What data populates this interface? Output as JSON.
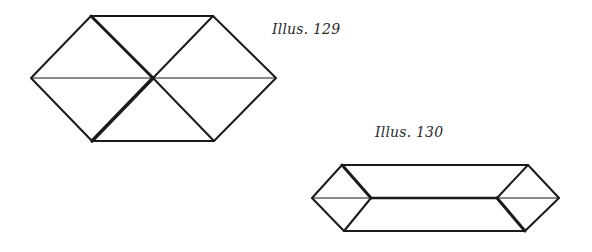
{
  "illustrations": [
    {
      "id": "129",
      "label": "Illus. 129",
      "shape": "hexagon divided into six triangles",
      "vertices": {
        "left": [
          31,
          78
        ],
        "top_left": [
          91,
          16
        ],
        "top_right": [
          213,
          16
        ],
        "right": [
          276,
          78
        ],
        "bottom_right": [
          214,
          141
        ],
        "bottom_left": [
          92,
          141
        ],
        "center": [
          153,
          78
        ]
      }
    },
    {
      "id": "130",
      "label": "Illus. 130",
      "shape": "elongated hexagon with end diamonds",
      "vertices": {
        "left": [
          312,
          198
        ],
        "top_left": [
          342,
          165
        ],
        "top_right": [
          528,
          165
        ],
        "right": [
          559,
          198
        ],
        "bottom_right": [
          525,
          231
        ],
        "bottom_left": [
          344,
          231
        ],
        "inner_left": [
          371,
          198
        ],
        "inner_right": [
          497,
          198
        ]
      }
    }
  ],
  "colors": {
    "line": "#1a1a1a",
    "background": "#ffffff"
  }
}
